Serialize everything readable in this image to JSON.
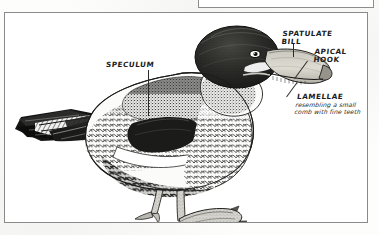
{
  "page": {
    "background_color": "#fdfdfc",
    "frame_border_color": "#8a8a8a"
  },
  "top_partial_box": {
    "label": ""
  },
  "figure": {
    "medium": "pen-and-ink stipple drawing",
    "species_depicted": "Northern Shoveler (dabbling duck)",
    "ink_color": "#1f1f1f",
    "paper_color": "#ffffff"
  },
  "annotations": [
    {
      "id": "speculum",
      "label": "SPECULUM",
      "style": "caps",
      "leader": "vertical-line-down"
    },
    {
      "id": "spatulate-bill",
      "label": "SPATULATE\nBILL",
      "style": "caps",
      "leader": "vertical-line-down"
    },
    {
      "id": "apical-hook",
      "label": "APICAL\nHOOK",
      "style": "caps",
      "leader": "diagonal-line-down-left"
    },
    {
      "id": "lamellae",
      "label": "LAMELLAE",
      "description": "resembling a small\ncomb with fine teeth",
      "style": "caps-with-italic-caption",
      "leader": "diagonal-line-up-left"
    }
  ]
}
